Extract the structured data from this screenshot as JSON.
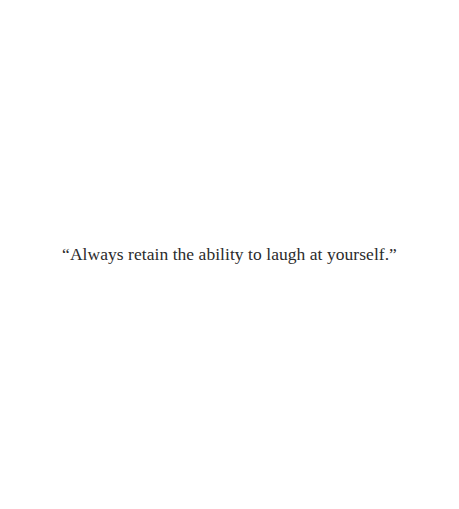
{
  "quote": {
    "text": "“Always retain the ability to laugh at yourself.”"
  },
  "colors": {
    "background": "#ffffff",
    "text": "#2b2b2b"
  }
}
